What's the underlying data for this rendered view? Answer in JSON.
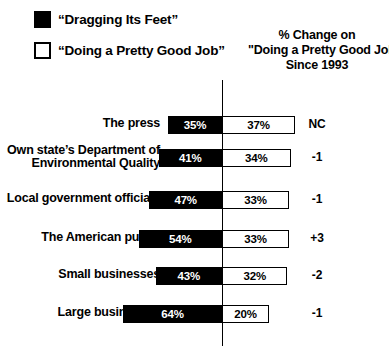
{
  "legend": {
    "items": [
      {
        "icon": "filled-square-swatch",
        "label": "“Dragging Its Feet”",
        "style": "filled",
        "color": "#000000"
      },
      {
        "icon": "hollow-square-swatch",
        "label": "“Doing a Pretty Good Job”",
        "style": "hollow",
        "color": "#ffffff"
      }
    ]
  },
  "column_header": {
    "line1": "% Change on",
    "line2": "\"Doing a Pretty Good Job\"",
    "line3": "Since 1993"
  },
  "chart_data": {
    "type": "bar",
    "title": "",
    "subtitle": "",
    "xlabel": "",
    "ylabel": "",
    "orientation": "horizontal-diverging",
    "grid": false,
    "legend_position": "top-left",
    "axis_center_value": 0,
    "units": "percent",
    "categories": [
      "The press",
      "Own state's Department of Environmental Quality",
      "Local government officials",
      "The American public",
      "Small businesses",
      "Large businesses"
    ],
    "category_lines": [
      [
        "The press"
      ],
      [
        "Own state’s Department of",
        "Environmental Quality"
      ],
      [
        "Local government officials"
      ],
      [
        "The American public"
      ],
      [
        "Small businesses"
      ],
      [
        "Large businesses"
      ]
    ],
    "series": [
      {
        "name": "“Dragging Its Feet”",
        "direction": "left",
        "color": "#000000",
        "values": [
          35,
          41,
          47,
          54,
          43,
          64
        ],
        "labels": [
          "35%",
          "41%",
          "47%",
          "54%",
          "43%",
          "64%"
        ]
      },
      {
        "name": "“Doing a Pretty Good Job”",
        "direction": "right",
        "color": "#ffffff",
        "values": [
          37,
          34,
          33,
          33,
          32,
          20
        ],
        "labels": [
          "37%",
          "34%",
          "33%",
          "33%",
          "32%",
          "20%"
        ]
      }
    ],
    "change_since_1993": [
      "NC",
      "-1",
      "-1",
      "+3",
      "-2",
      "-1"
    ]
  }
}
